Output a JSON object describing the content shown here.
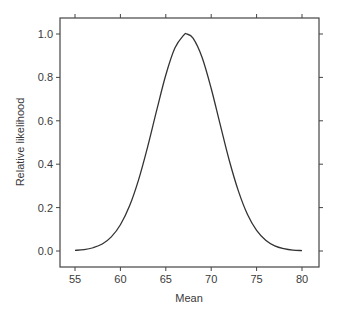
{
  "chart_data": {
    "type": "line",
    "title": "",
    "xlabel": "Mean",
    "ylabel": "Relative likelihood",
    "xlim": [
      55,
      80
    ],
    "ylim": [
      0.0,
      1.0
    ],
    "x_ticks": [
      55,
      60,
      65,
      70,
      75,
      80
    ],
    "x_tick_labels": [
      "55",
      "60",
      "65",
      "70",
      "75",
      "80"
    ],
    "y_ticks": [
      0.0,
      0.2,
      0.4,
      0.6,
      0.8,
      1.0
    ],
    "y_tick_labels": [
      "0.0",
      "0.2",
      "0.4",
      "0.6",
      "0.8",
      "1.0"
    ],
    "grid": false,
    "legend": null,
    "series": [
      {
        "name": "Relative likelihood",
        "x": [
          55,
          56,
          57,
          58,
          59,
          60,
          61,
          62,
          63,
          64,
          65,
          66,
          67,
          67.3,
          68,
          69,
          70,
          71,
          72,
          73,
          74,
          75,
          76,
          77,
          78,
          79,
          80
        ],
        "values": [
          0.003,
          0.006,
          0.015,
          0.032,
          0.065,
          0.121,
          0.207,
          0.328,
          0.48,
          0.649,
          0.811,
          0.935,
          0.996,
          1.0,
          0.981,
          0.892,
          0.749,
          0.581,
          0.416,
          0.276,
          0.168,
          0.095,
          0.05,
          0.024,
          0.011,
          0.004,
          0.002
        ]
      }
    ],
    "line_color": "#333333",
    "axis_color": "#444444"
  }
}
